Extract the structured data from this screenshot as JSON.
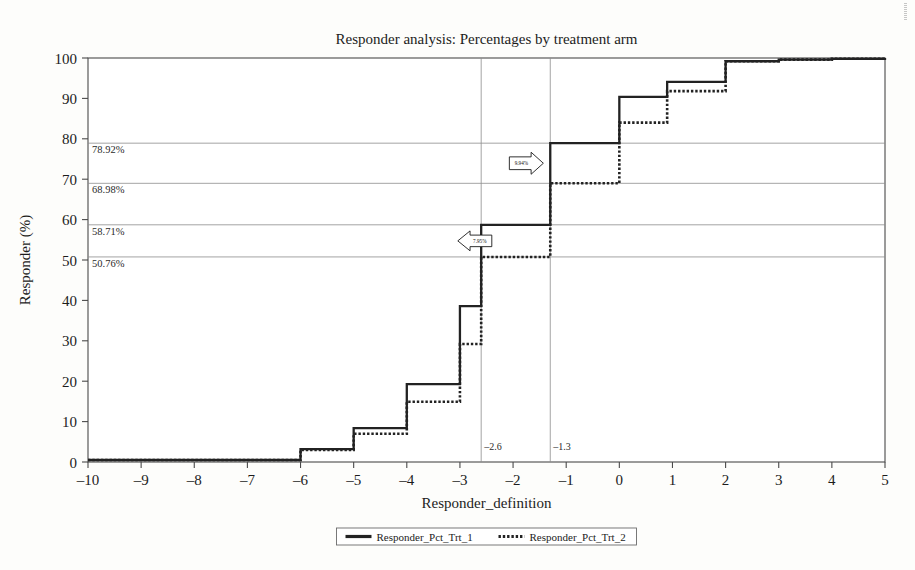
{
  "chart_data": {
    "type": "line",
    "title": "Responder analysis: Percentages by treatment arm",
    "xlabel": "Responder_definition",
    "ylabel": "Responder (%)",
    "xlim": [
      -10,
      5
    ],
    "ylim": [
      0,
      100
    ],
    "xticks": [
      "–10",
      "–9",
      "–8",
      "–7",
      "–6",
      "–5",
      "–4",
      "–3",
      "–2",
      "–1",
      "0",
      "1",
      "2",
      "3",
      "4",
      "5"
    ],
    "xtick_values": [
      -10,
      -9,
      -8,
      -7,
      -6,
      -5,
      -4,
      -3,
      -2,
      -1,
      0,
      1,
      2,
      3,
      4,
      5
    ],
    "yticks": [
      "0",
      "10",
      "20",
      "30",
      "40",
      "50",
      "60",
      "70",
      "80",
      "90",
      "100"
    ],
    "ytick_values": [
      0,
      10,
      20,
      30,
      40,
      50,
      60,
      70,
      80,
      90,
      100
    ],
    "grid": false,
    "legend_position": "bottom",
    "step_type": "post",
    "series": [
      {
        "name": "Responder_Pct_Trt_1",
        "style": "solid",
        "x": [
          -10,
          -9,
          -8,
          -7,
          -6,
          -5,
          -4,
          -3,
          -2.6,
          -2,
          -1.3,
          -1,
          0,
          0.9,
          2,
          3,
          4,
          5
        ],
        "y": [
          0.5,
          0.5,
          0.5,
          0.5,
          3.2,
          8.4,
          19.3,
          38.6,
          58.71,
          58.71,
          78.92,
          78.92,
          90.4,
          94.1,
          99.2,
          99.6,
          99.8,
          100.0
        ]
      },
      {
        "name": "Responder_Pct_Trt_2",
        "style": "dotted",
        "x": [
          -10,
          -9,
          -8,
          -7,
          -6,
          -5,
          -4,
          -3,
          -2.6,
          -2,
          -1.3,
          -1,
          0,
          0.9,
          2,
          3,
          4,
          5
        ],
        "y": [
          0.5,
          0.5,
          0.5,
          0.5,
          3.0,
          7.0,
          14.9,
          29.2,
          50.76,
          50.76,
          68.98,
          68.98,
          84.0,
          91.8,
          99.2,
          99.6,
          99.8,
          100.0
        ]
      }
    ],
    "reference_lines_y": [
      {
        "value": 78.92,
        "label": "78.92%"
      },
      {
        "value": 68.98,
        "label": "68.98%"
      },
      {
        "value": 58.71,
        "label": "58.71%"
      },
      {
        "value": 50.76,
        "label": "50.76%"
      }
    ],
    "reference_lines_x": [
      {
        "value": -2.6,
        "label": "–2.6"
      },
      {
        "value": -1.3,
        "label": "–1.3"
      }
    ],
    "annotations": [
      {
        "label": "9.94%",
        "direction": "right",
        "x": -1.75,
        "y_top": 78.92,
        "y_bottom": 68.98
      },
      {
        "label": "7.95%",
        "direction": "left",
        "x": -2.72,
        "y_top": 58.71,
        "y_bottom": 50.76
      }
    ]
  },
  "legend": {
    "items": [
      {
        "label": "Responder_Pct_Trt_1",
        "style": "solid"
      },
      {
        "label": "Responder_Pct_Trt_2",
        "style": "dotted"
      }
    ]
  }
}
